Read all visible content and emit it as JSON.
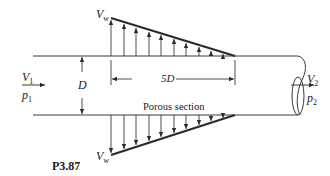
{
  "figure": {
    "id": "P3.87",
    "caption": "P3.87"
  },
  "labels": {
    "vw_top": {
      "main": "V",
      "sub": "w"
    },
    "vw_bottom": {
      "main": "V",
      "sub": "w"
    },
    "v1": {
      "main": "V",
      "sub": "1"
    },
    "p1": {
      "main": "p",
      "sub": "1"
    },
    "v2": {
      "main": "V",
      "sub": "2"
    },
    "p2": {
      "main": "p",
      "sub": "2"
    },
    "diameter": "D",
    "length": "5D",
    "porous": "Porous section"
  },
  "colors": {
    "line": "#3a3a3a",
    "heavy_line": "#2a2a2a",
    "text": "#1a1a1a"
  }
}
